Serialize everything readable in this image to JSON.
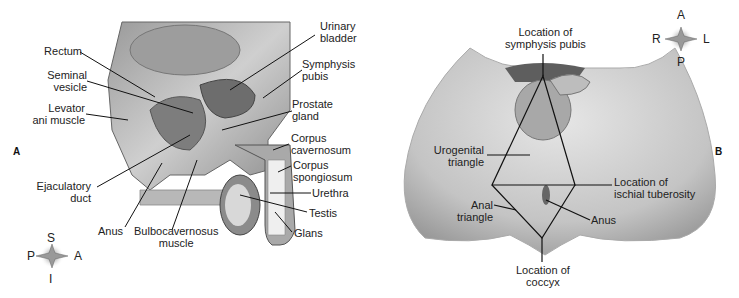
{
  "panel_a": {
    "letter": "A",
    "labels": {
      "rectum": "Rectum",
      "seminal_vesicle": "Seminal\nvesicle",
      "levator_ani": "Levator\nani muscle",
      "ejaculatory_duct": "Ejaculatory\nduct",
      "anus": "Anus",
      "bulbocavernosus": "Bulbocavernosus\nmuscle",
      "urinary_bladder": "Urinary\nbladder",
      "symphysis_pubis": "Symphysis\npubis",
      "prostate_gland": "Prostate\ngland",
      "corpus_cavernosum": "Corpus\ncavernosum",
      "corpus_spongiosum": "Corpus\nspongiosum",
      "urethra": "Urethra",
      "testis": "Testis",
      "glans": "Glans"
    },
    "compass": {
      "top": "S",
      "left": "P",
      "right": "A",
      "bottom": "I"
    }
  },
  "panel_b": {
    "letter": "B",
    "labels": {
      "symphysis_location": "Location of\nsymphysis pubis",
      "urogenital_triangle": "Urogenital\ntriangle",
      "ischial_tuberosity": "Location of\nischial tuberosity",
      "anal_triangle": "Anal\ntriangle",
      "anus": "Anus",
      "coccyx_location": "Location of\ncoccyx"
    },
    "compass": {
      "top": "A",
      "left": "R",
      "right": "L",
      "bottom": "P"
    }
  }
}
